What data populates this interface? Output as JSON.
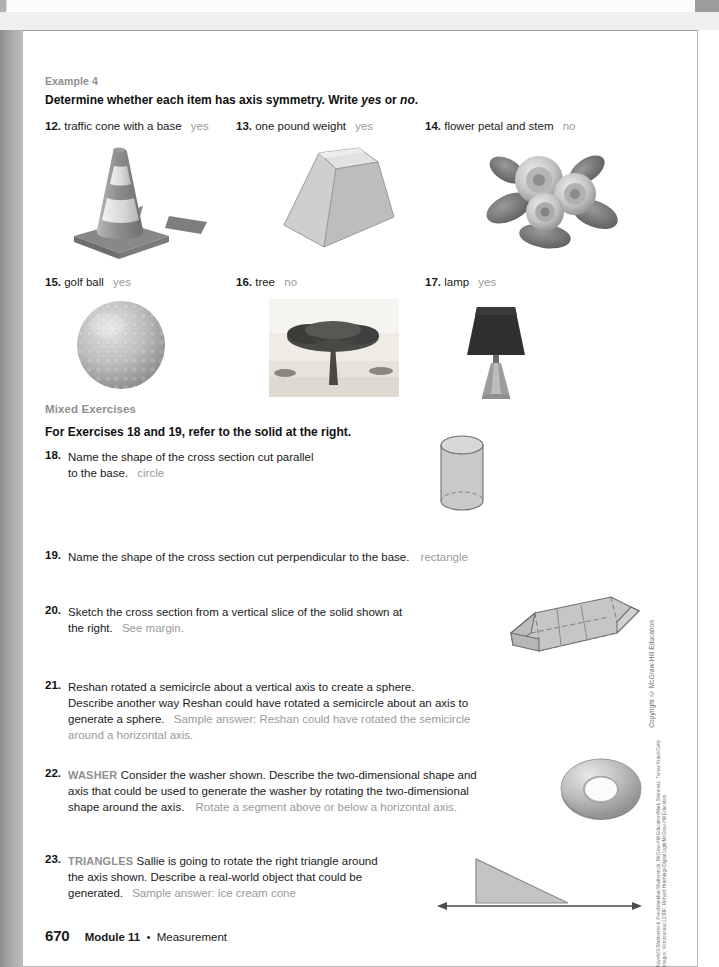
{
  "document": {
    "page_number": "670",
    "module": "Module 11",
    "separator": "•",
    "module_topic": "Measurement",
    "copyright": "Copyright © McGraw-Hill Education",
    "photo_credits": "Kayeh79/Shutterstock; Penchilankhar/Shutterstock; McGraw-Hill Education/Mark Steinmetz; Tomaz Kunst/Getty Images; Victorsaonac/123RF; Richard Hutchings/Digital Light/McGraw-Hill Education"
  },
  "example_section": {
    "label": "Example 4",
    "direction_prefix": "Determine whether each item has axis symmetry. Write ",
    "direction_yes": "yes",
    "direction_or": " or ",
    "direction_no": "no",
    "direction_end": "."
  },
  "symmetry_exercises": [
    {
      "num": "12.",
      "text": "traffic cone with a base",
      "answer": "yes",
      "figure": "traffic-cone"
    },
    {
      "num": "13.",
      "text": "one pound weight",
      "answer": "yes",
      "figure": "one-pound-weight"
    },
    {
      "num": "14.",
      "text": "flower petal and stem",
      "answer": "no",
      "figure": "flower"
    },
    {
      "num": "15.",
      "text": "golf ball",
      "answer": "yes",
      "figure": "golf-ball"
    },
    {
      "num": "16.",
      "text": "tree",
      "answer": "no",
      "figure": "tree"
    },
    {
      "num": "17.",
      "text": "lamp",
      "answer": "yes",
      "figure": "lamp"
    }
  ],
  "mixed_exercises": {
    "label": "Mixed Exercises",
    "direction": "For Exercises 18 and 19, refer to the solid at the right.",
    "items": [
      {
        "num": "18.",
        "line1": "Name the shape of the cross section cut parallel",
        "line2": "to the base.",
        "answer": "circle",
        "figure": "cylinder"
      },
      {
        "num": "19.",
        "line1": "Name the shape of the cross section cut perpendicular to the base.",
        "answer": "rectangle",
        "figure": ""
      },
      {
        "num": "20.",
        "line1": "Sketch the cross section from a vertical slice of the solid shown at",
        "line2": "the right.",
        "answer": "See margin.",
        "figure": "hexagonal-prism"
      },
      {
        "num": "21.",
        "line1": "Reshan rotated a semicircle about a vertical axis to create a sphere.",
        "line2": "Describe another way Reshan could have rotated a semicircle about an axis to",
        "line3": "generate a sphere.",
        "answer": "Sample answer: Reshan could have rotated the semicircle",
        "answer2": "around a horizontal axis.",
        "figure": ""
      },
      {
        "num": "22.",
        "category": "WASHER",
        "line1": "Consider the washer shown. Describe the two-dimensional shape and",
        "line2": "axis that could be used to generate the washer by rotating the two-dimensional",
        "line3": "shape around the axis.",
        "answer": "Rotate a segment above or below a horizontal axis.",
        "figure": "washer"
      },
      {
        "num": "23.",
        "category": "TRIANGLES",
        "line1": "Sallie is going to rotate the right triangle around",
        "line2": "the axis shown. Describe a real-world object that could be",
        "line3": "generated.",
        "answer": "Sample answer: ice cream cone",
        "figure": "right-triangle-axis"
      }
    ]
  },
  "colors": {
    "answer_gray": "#9a9a9a",
    "label_gray": "#8f8f8f",
    "text_black": "#1a1a1a",
    "solid_fill": "#c9c9c9",
    "solid_stroke": "#6f6f6f"
  }
}
